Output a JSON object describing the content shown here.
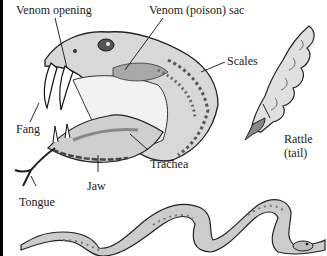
{
  "diagram": {
    "labels": {
      "venom_opening": "Venom opening",
      "venom_sac": "Venom (poison) sac",
      "scales": "Scales",
      "fang": "Fang",
      "trachea": "Trachea",
      "jaw": "Jaw",
      "tongue": "Tongue",
      "rattle": "Rattle",
      "rattle_sub": "(tail)"
    },
    "colors": {
      "ink": "#1a1a1a",
      "shade": "#9a9a9a",
      "light": "#d9d9d9",
      "background": "#ffffff"
    }
  }
}
